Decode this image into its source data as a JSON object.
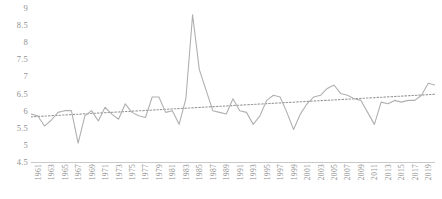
{
  "chart_data": {
    "type": "line",
    "title": "",
    "subtitle": "",
    "xlabel": "",
    "ylabel": "",
    "xlim": [
      1960,
      2020
    ],
    "ylim": [
      4.5,
      9
    ],
    "yticks": [
      4.5,
      5,
      5.5,
      6,
      6.5,
      7,
      7.5,
      8,
      8.5,
      9
    ],
    "ytick_labels": [
      "4.5",
      "5",
      "5.5",
      "6",
      "6.5",
      "7",
      "7.5",
      "8",
      "8.5",
      "9"
    ],
    "xticks": [
      1961,
      1963,
      1965,
      1967,
      1969,
      1971,
      1973,
      1975,
      1977,
      1979,
      1981,
      1983,
      1985,
      1987,
      1989,
      1991,
      1993,
      1995,
      1997,
      1999,
      2001,
      2003,
      2005,
      2007,
      2009,
      2011,
      2013,
      2015,
      2017,
      2019
    ],
    "xtick_labels": [
      "1961",
      "1963",
      "1965",
      "1967",
      "1969",
      "1971",
      "1973",
      "1975",
      "1977",
      "1979",
      "1981",
      "1983",
      "1985",
      "1987",
      "1989",
      "1991",
      "1993",
      "1995",
      "1997",
      "1999",
      "2001",
      "2003",
      "2005",
      "2007",
      "2009",
      "2011",
      "2013",
      "2015",
      "2017",
      "2019"
    ],
    "grid": false,
    "legend": null,
    "series": [
      {
        "name": "value",
        "style": "solid",
        "color": "#b0b0b0",
        "x": [
          1960,
          1961,
          1962,
          1963,
          1964,
          1965,
          1966,
          1967,
          1968,
          1969,
          1970,
          1971,
          1972,
          1973,
          1974,
          1975,
          1976,
          1977,
          1978,
          1979,
          1980,
          1981,
          1982,
          1983,
          1984,
          1985,
          1986,
          1987,
          1988,
          1989,
          1990,
          1991,
          1992,
          1993,
          1994,
          1995,
          1996,
          1997,
          1998,
          1999,
          2000,
          2001,
          2002,
          2003,
          2004,
          2005,
          2006,
          2007,
          2008,
          2009,
          2010,
          2011,
          2012,
          2013,
          2014,
          2015,
          2016,
          2017,
          2018,
          2019,
          2020
        ],
        "values": [
          5.9,
          5.85,
          5.55,
          5.72,
          5.95,
          6.0,
          6.0,
          5.05,
          5.85,
          6.0,
          5.7,
          6.1,
          5.9,
          5.75,
          6.2,
          5.95,
          5.85,
          5.8,
          6.4,
          6.4,
          5.95,
          6.0,
          5.6,
          6.35,
          8.8,
          7.2,
          6.6,
          6.0,
          5.95,
          5.9,
          6.35,
          6.0,
          5.95,
          5.6,
          5.85,
          6.3,
          6.45,
          6.4,
          5.95,
          5.45,
          5.9,
          6.2,
          6.4,
          6.45,
          6.65,
          6.75,
          6.5,
          6.45,
          6.35,
          6.3,
          5.95,
          5.6,
          6.25,
          6.2,
          6.3,
          6.25,
          6.3,
          6.3,
          6.45,
          6.8,
          6.75
        ]
      },
      {
        "name": "trendline",
        "style": "dotted",
        "color": "#9a9a9a",
        "x": [
          1960,
          2020
        ],
        "values": [
          5.82,
          6.48
        ]
      }
    ]
  }
}
